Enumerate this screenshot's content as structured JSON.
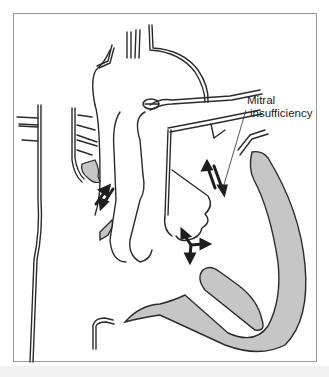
{
  "figure": {
    "type": "anatomical-illustration",
    "annotations": [
      {
        "id": "mitral",
        "line1": "Mitral",
        "line2": "insufficiency"
      }
    ],
    "colors": {
      "outline": "#2a2a2a",
      "myocardium": "#c6c6c6",
      "background": "#ffffff",
      "frame": "#9a9a9a",
      "arrows": "#1e1e1e"
    },
    "arrows": [
      {
        "name": "tricuspid-regurgitation-arrows",
        "count": 2
      },
      {
        "name": "mitral-regurgitation-arrows",
        "count": 2
      },
      {
        "name": "ventricular-flow-arrows",
        "count": 3
      }
    ]
  }
}
